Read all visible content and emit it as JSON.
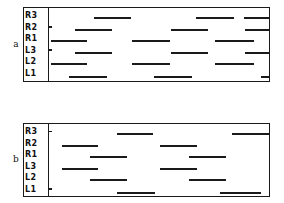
{
  "figure": {
    "type": "gait-diagram",
    "row_labels": [
      "R3",
      "R2",
      "R1",
      "L3",
      "L2",
      "L1"
    ],
    "panels": [
      {
        "caption": "a",
        "rows": [
          {
            "label": "R3",
            "tick": false,
            "segments": [
              {
                "start": 20.5,
                "width": 17.0
              },
              {
                "start": 67.0,
                "width": 17.0
              },
              {
                "start": 88.5,
                "width": 11.5
              }
            ]
          },
          {
            "label": "R2",
            "tick": true,
            "segments": [
              {
                "start": 12.0,
                "width": 16.5
              },
              {
                "start": 55.5,
                "width": 17.0
              },
              {
                "start": 89.0,
                "width": 11.0
              }
            ]
          },
          {
            "label": "R1",
            "tick": false,
            "segments": [
              {
                "start": 1.0,
                "width": 16.5
              },
              {
                "start": 37.5,
                "width": 17.5
              },
              {
                "start": 75.5,
                "width": 17.5
              }
            ]
          },
          {
            "label": "L3",
            "tick": true,
            "segments": [
              {
                "start": 12.0,
                "width": 16.5
              },
              {
                "start": 55.5,
                "width": 17.0
              },
              {
                "start": 89.0,
                "width": 11.0
              }
            ]
          },
          {
            "label": "L2",
            "tick": false,
            "segments": [
              {
                "start": 1.0,
                "width": 16.5
              },
              {
                "start": 37.5,
                "width": 17.5
              },
              {
                "start": 75.5,
                "width": 17.5
              }
            ]
          },
          {
            "label": "L1",
            "tick": false,
            "segments": [
              {
                "start": 9.0,
                "width": 17.5
              },
              {
                "start": 47.5,
                "width": 17.5
              },
              {
                "start": 96.5,
                "width": 3.5
              }
            ]
          }
        ]
      },
      {
        "caption": "b",
        "rows": [
          {
            "label": "R3",
            "tick": true,
            "segments": [
              {
                "start": 31.0,
                "width": 16.5
              },
              {
                "start": 83.0,
                "width": 17.0
              }
            ]
          },
          {
            "label": "R2",
            "tick": false,
            "segments": [
              {
                "start": 6.0,
                "width": 16.5
              },
              {
                "start": 50.5,
                "width": 17.0
              }
            ]
          },
          {
            "label": "R1",
            "tick": false,
            "segments": [
              {
                "start": 18.5,
                "width": 17.0
              },
              {
                "start": 63.5,
                "width": 17.0
              }
            ]
          },
          {
            "label": "L3",
            "tick": false,
            "segments": [
              {
                "start": 6.0,
                "width": 16.5
              },
              {
                "start": 50.5,
                "width": 17.0
              }
            ]
          },
          {
            "label": "L2",
            "tick": false,
            "segments": [
              {
                "start": 18.5,
                "width": 17.0
              },
              {
                "start": 63.5,
                "width": 17.0
              }
            ]
          },
          {
            "label": "L1",
            "tick": true,
            "segments": [
              {
                "start": 31.0,
                "width": 17.0
              },
              {
                "start": 77.5,
                "width": 19.0
              }
            ]
          }
        ]
      }
    ]
  },
  "chart_data": {
    "type": "bar",
    "title": "",
    "xlabel": "",
    "ylabel": "",
    "categories": [
      "R3",
      "R2",
      "R1",
      "L3",
      "L2",
      "L1"
    ],
    "legend": [],
    "grid": false,
    "series": [
      {
        "name": "a",
        "values": [
          3,
          3,
          3,
          3,
          3,
          3
        ]
      },
      {
        "name": "b",
        "values": [
          2,
          2,
          2,
          2,
          2,
          2
        ]
      }
    ]
  }
}
